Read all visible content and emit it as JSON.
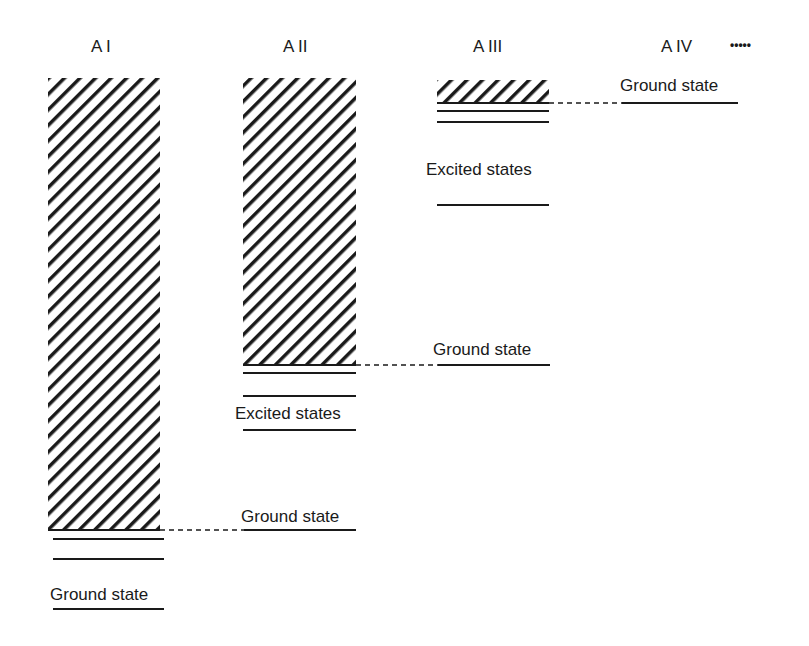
{
  "diagram": {
    "columns": [
      {
        "id": "AI",
        "title": "A I",
        "band_label": null,
        "levels": [
          "Ground state"
        ],
        "lower_label": "Ground state"
      },
      {
        "id": "AII",
        "title": "A II",
        "lower_label": "Excited states",
        "ground_label": "Ground state"
      },
      {
        "id": "AIII",
        "title": "A III",
        "lower_label": "Excited states",
        "ground_label": "Ground state"
      },
      {
        "id": "AIV",
        "title": "A IV",
        "ground_label": "Ground state"
      }
    ],
    "continuation": "•••••",
    "labels": {
      "ai_title": "A I",
      "aii_title": "A II",
      "aiii_title": "A III",
      "aiv_title": "A IV",
      "dots": "•••••",
      "aiv_ground": "Ground state",
      "aiii_excited": "Excited states",
      "aiii_ground_from_aii": "Ground state",
      "aii_excited": "Excited states",
      "aii_ground_from_ai": "Ground state",
      "ai_ground": "Ground state"
    },
    "colors": {
      "line": "#1a1a1a",
      "background": "#ffffff"
    }
  }
}
